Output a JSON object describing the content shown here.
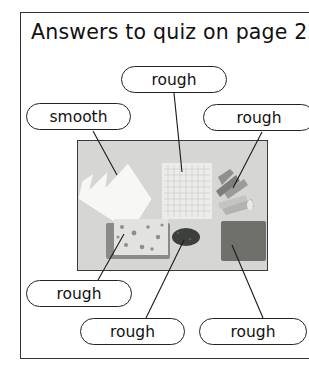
{
  "title": "Answers to quiz on page 22",
  "labels": [
    {
      "id": "top",
      "text": "rough",
      "material": "bubble wrap"
    },
    {
      "id": "left",
      "text": "smooth",
      "material": "paper"
    },
    {
      "id": "right",
      "text": "rough",
      "material": "pasta"
    },
    {
      "id": "bottom_left",
      "text": "rough",
      "material": "foil"
    },
    {
      "id": "bottom_mid",
      "text": "rough",
      "material": "gravel"
    },
    {
      "id": "bottom_right",
      "text": "rough",
      "material": "sponge"
    }
  ],
  "colors": {
    "frame": "#333333",
    "photo_background": "#d6d6d4",
    "sponge": "#6f706c",
    "gravel": "#3d3f3a"
  }
}
